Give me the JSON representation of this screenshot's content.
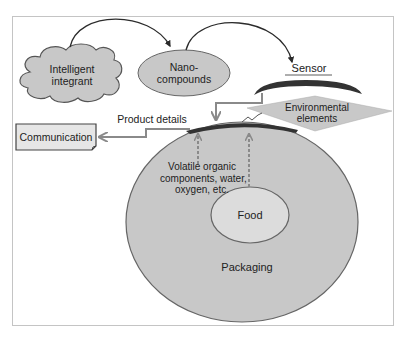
{
  "diagram": {
    "nodes": {
      "intelligent_integrant": {
        "line1": "Intelligent",
        "line2": "integrant"
      },
      "nano_compounds": {
        "line1": "Nano-",
        "line2": "compounds"
      },
      "sensor": {
        "label": "Sensor"
      },
      "environmental_elements": {
        "line1": "Environmental",
        "line2": "elements"
      },
      "communication": {
        "label": "Communication"
      },
      "volatiles": {
        "line1": "Volatile organic",
        "line2": "components, water,",
        "line3": "oxygen, etc."
      },
      "food": {
        "label": "Food"
      },
      "packaging": {
        "label": "Packaging"
      }
    },
    "edges": {
      "product_details": {
        "label": "Product details"
      }
    },
    "colors": {
      "shape_fill": "#c8c8c8",
      "shape_stroke": "#555555",
      "sensor_band": "#333333",
      "arrow_grey": "#8a8a8a",
      "arrow_dark": "#2b2b2b",
      "food_fill": "#dcdcdc",
      "frame": "#c4c4c4"
    }
  }
}
